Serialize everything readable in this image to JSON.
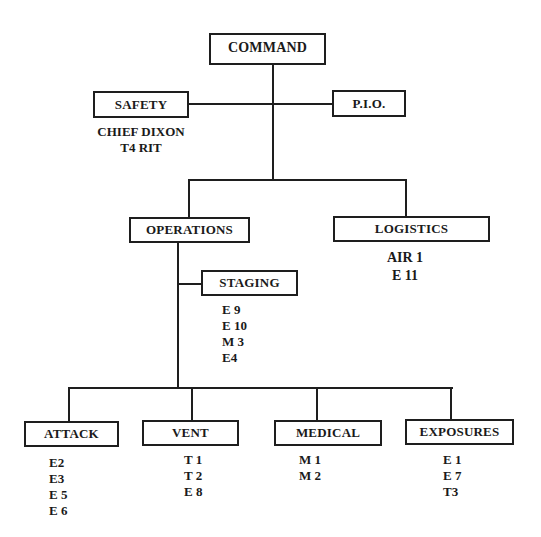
{
  "chart": {
    "command": {
      "label": "COMMAND"
    },
    "safety": {
      "label": "SAFETY",
      "assigned": [
        "CHIEF DIXON",
        "T4 RIT"
      ]
    },
    "pio": {
      "label": "P.I.O."
    },
    "operations": {
      "label": "OPERATIONS"
    },
    "logistics": {
      "label": "LOGISTICS",
      "assigned": [
        "AIR 1",
        "E 11"
      ]
    },
    "staging": {
      "label": "STAGING",
      "assigned": [
        "E 9",
        "E 10",
        "M 3",
        "E4"
      ]
    },
    "divisions": [
      {
        "label": "ATTACK",
        "assigned": [
          "E2",
          "E3",
          "E 5",
          "E 6"
        ]
      },
      {
        "label": "VENT",
        "assigned": [
          "T 1",
          "T 2",
          "E 8"
        ]
      },
      {
        "label": "MEDICAL",
        "assigned": [
          "M 1",
          "M 2"
        ]
      },
      {
        "label": "EXPOSURES",
        "assigned": [
          "E 1",
          "E 7",
          "T3"
        ]
      }
    ]
  },
  "colors": {
    "line": "#1e1e1e",
    "background": "#ffffff",
    "text": "#1a1a1a"
  }
}
